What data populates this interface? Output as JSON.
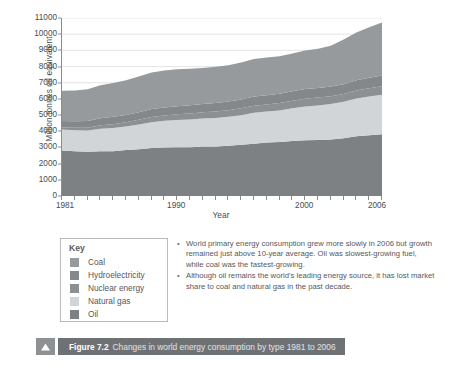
{
  "figure": {
    "marker_icon": "triangle-up-icon",
    "number_label": "Figure 7.2",
    "caption": "Changes in world energy consumption by type 1981 to 2006"
  },
  "legend": {
    "title": "Key",
    "items": [
      {
        "label": "Coal",
        "color": "#969a9d"
      },
      {
        "label": "Hydroelectricity",
        "color": "#85888b"
      },
      {
        "label": "Nuclear energy",
        "color": "#8c9093"
      },
      {
        "label": "Natural gas",
        "color": "#d2d5d7"
      },
      {
        "label": "Oil",
        "color": "#7e8184"
      }
    ]
  },
  "notes": {
    "bullets": [
      "World primary energy consumption grew more slowly in 2006 but growth remained just above 10-year average. Oil was slowest-growing fuel, while coal was the fastest-growing.",
      "Although oil remains the world's leading energy source, it has lost market share to coal and natural gas in the past decade."
    ]
  },
  "chart_data": {
    "type": "area",
    "title": "",
    "xlabel": "Year",
    "ylabel": "Million tonnes oil equivalent",
    "xlim": [
      1981,
      2006
    ],
    "ylim": [
      0,
      11000
    ],
    "ytick_step": 1000,
    "yticks": [
      0,
      1000,
      2000,
      3000,
      4000,
      5000,
      6000,
      7000,
      8000,
      9000,
      10000,
      11000
    ],
    "xticks": [
      1981,
      1982,
      1983,
      1984,
      1985,
      1986,
      1987,
      1988,
      1989,
      1990,
      1991,
      1992,
      1993,
      1994,
      1995,
      1996,
      1997,
      1998,
      1999,
      2000,
      2001,
      2002,
      2003,
      2004,
      2005,
      2006
    ],
    "xtick_labels": [
      1981,
      1990,
      2000,
      2006
    ],
    "grid": "horizontal",
    "legend_position": "below-left",
    "stacked": true,
    "stack_order_bottom_to_top": [
      "Oil",
      "Natural gas",
      "Nuclear energy",
      "Hydroelectricity",
      "Coal"
    ],
    "x": [
      1981,
      1982,
      1983,
      1984,
      1985,
      1986,
      1987,
      1988,
      1989,
      1990,
      1991,
      1992,
      1993,
      1994,
      1995,
      1996,
      1997,
      1998,
      1999,
      2000,
      2001,
      2002,
      2003,
      2004,
      2005,
      2006
    ],
    "series": [
      {
        "name": "Oil",
        "color": "#7e8184",
        "values": [
          2810,
          2760,
          2730,
          2760,
          2760,
          2840,
          2890,
          2960,
          3000,
          3020,
          3020,
          3060,
          3060,
          3110,
          3160,
          3230,
          3300,
          3330,
          3400,
          3440,
          3460,
          3490,
          3570,
          3700,
          3760,
          3810
        ]
      },
      {
        "name": "Natural gas",
        "color": "#d2d5d7",
        "values": [
          1300,
          1310,
          1320,
          1400,
          1440,
          1450,
          1530,
          1600,
          1650,
          1680,
          1710,
          1730,
          1760,
          1780,
          1830,
          1910,
          1920,
          1960,
          2020,
          2090,
          2130,
          2190,
          2250,
          2320,
          2390,
          2450
        ]
      },
      {
        "name": "Nuclear energy",
        "color": "#8c9093",
        "values": [
          130,
          150,
          170,
          210,
          240,
          260,
          290,
          320,
          330,
          350,
          370,
          380,
          400,
          410,
          430,
          440,
          440,
          450,
          470,
          480,
          490,
          490,
          480,
          500,
          510,
          520
        ]
      },
      {
        "name": "Hydroelectricity",
        "color": "#85888b",
        "values": [
          390,
          400,
          420,
          440,
          450,
          460,
          470,
          490,
          490,
          500,
          510,
          510,
          530,
          540,
          550,
          570,
          570,
          580,
          590,
          600,
          590,
          600,
          610,
          630,
          650,
          670
        ]
      },
      {
        "name": "Coal",
        "color": "#969a9d",
        "values": [
          1880,
          1900,
          1950,
          2030,
          2100,
          2140,
          2200,
          2260,
          2290,
          2280,
          2260,
          2230,
          2230,
          2240,
          2280,
          2320,
          2330,
          2320,
          2320,
          2380,
          2430,
          2520,
          2760,
          2960,
          3120,
          3270
        ]
      }
    ]
  }
}
